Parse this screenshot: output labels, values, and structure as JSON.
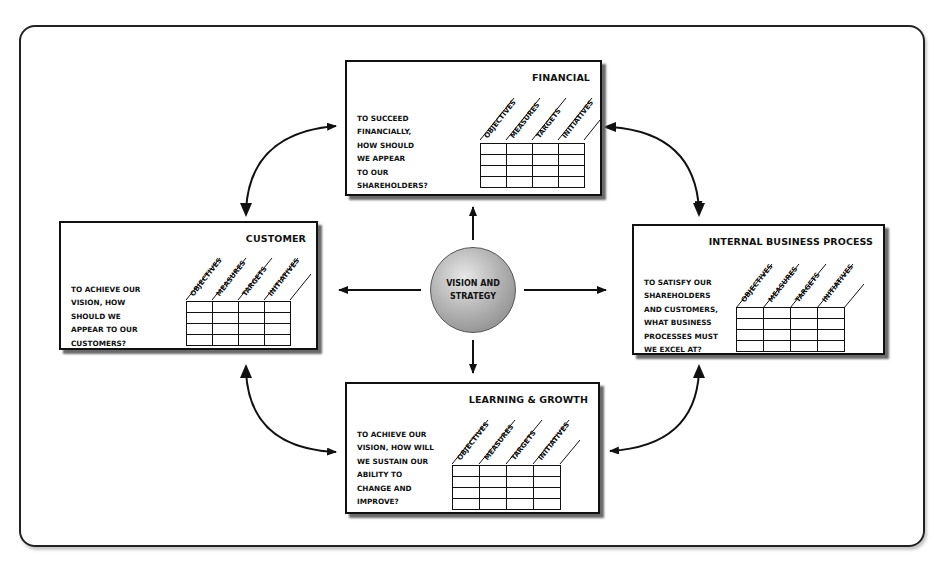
{
  "diagram": {
    "center": {
      "label": "VISION AND\nSTRATEGY"
    },
    "columns": [
      "OBJECTIVES",
      "MEASURES",
      "TARGETS",
      "INITIATIVES"
    ],
    "perspectives": [
      {
        "id": "financial",
        "title": "FINANCIAL",
        "question": "TO SUCCEED\nFINANCIALLY,\nHOW SHOULD\nWE APPEAR\nTO OUR\nSHAREHOLDERS?"
      },
      {
        "id": "customer",
        "title": "CUSTOMER",
        "question": "TO ACHIEVE OUR\nVISION, HOW\nSHOULD WE\nAPPEAR TO OUR\nCUSTOMERS?"
      },
      {
        "id": "internal",
        "title": "INTERNAL BUSINESS PROCESS",
        "question": "TO SATISFY OUR\nSHAREHOLDERS\nAND CUSTOMERS,\nWHAT BUSINESS\nPROCESSES MUST\nWE EXCEL AT?"
      },
      {
        "id": "learning",
        "title": "LEARNING & GROWTH",
        "question": "TO ACHIEVE OUR\nVISION, HOW WILL\nWE SUSTAIN OUR\nABILITY TO\nCHANGE AND\nIMPROVE?"
      }
    ],
    "grid_rows": 4,
    "colors": {
      "line": "#111111",
      "shadow": "#6a6a6a",
      "sphere_light": "#e8e8e8",
      "sphere_dark": "#7d7d7d"
    }
  }
}
